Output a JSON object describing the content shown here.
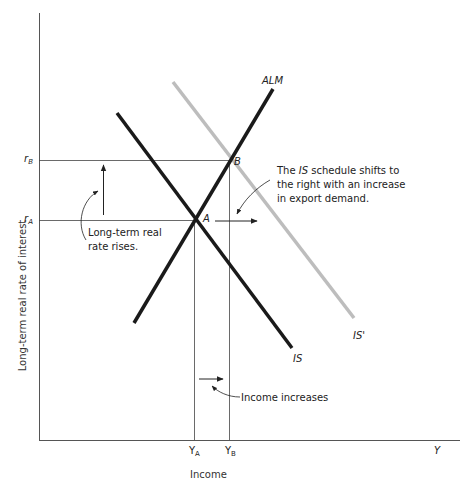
{
  "axes": {
    "y_label": "Long-term real rate of interest",
    "x_label": "Income",
    "x_end_label": "Y"
  },
  "ticks": {
    "rA": {
      "base": "r",
      "sub": "A"
    },
    "rB": {
      "base": "r",
      "sub": "B"
    },
    "YA": {
      "base": "Y",
      "sub": "A"
    },
    "YB": {
      "base": "Y",
      "sub": "B"
    }
  },
  "curves": {
    "IS": {
      "label": "IS",
      "color": "#1a1a1a"
    },
    "IS_prime": {
      "label": "IS'",
      "color": "#bdbdbd"
    },
    "ALM": {
      "label": "ALM",
      "color": "#1a1a1a"
    }
  },
  "points": {
    "A": "A",
    "B": "B"
  },
  "annotations": {
    "shift": [
      "The IS schedule shifts to",
      "the right with an increase",
      "in export demand."
    ],
    "shift_parts": {
      "pre": "The ",
      "italic": "IS",
      "post": " schedule shifts to",
      "line2": "the right with an increase",
      "line3": "in export demand."
    },
    "rate": [
      "Long-term real",
      "rate rises."
    ],
    "income": "Income increases"
  }
}
